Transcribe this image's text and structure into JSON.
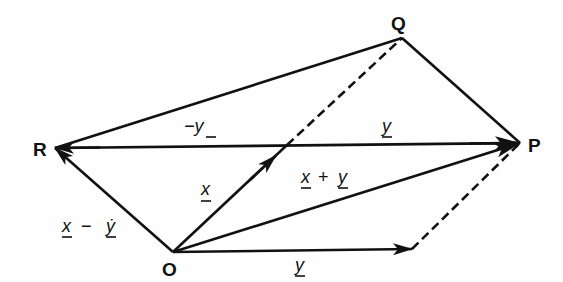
{
  "diagram": {
    "type": "vector-parallelogram",
    "points": {
      "O": {
        "label": "O",
        "x": 173,
        "y": 252
      },
      "P": {
        "label": "P",
        "x": 520,
        "y": 143
      },
      "Q": {
        "label": "Q",
        "x": 402,
        "y": 38
      },
      "R": {
        "label": "R",
        "x": 55,
        "y": 148
      }
    },
    "labels": {
      "x": "x",
      "y_top": "y",
      "y_bottom": "y",
      "neg_y": "−y",
      "x_plus_y_x": "x",
      "x_plus_y_op": "+",
      "x_plus_y_y": "y",
      "x_minus_y_x": "x",
      "x_minus_y_op": "−",
      "x_minus_y_y": "ẏ"
    },
    "edges": [
      {
        "from": "O",
        "to": "A",
        "label": "x",
        "style": "arrow"
      },
      {
        "from": "A",
        "to": "Q",
        "style": "dashed"
      },
      {
        "from": "O",
        "to": "B",
        "label": "y",
        "style": "arrow"
      },
      {
        "from": "B",
        "to": "P",
        "style": "dashed"
      },
      {
        "from": "O",
        "to": "P",
        "label": "x + y",
        "style": "arrow"
      },
      {
        "from": "O",
        "to": "R",
        "label": "x − y",
        "style": "arrow"
      },
      {
        "from": "R",
        "to": "P",
        "label": "y",
        "style": "arrow"
      },
      {
        "from": "P",
        "to": "R",
        "label": "−y",
        "style": "arrow"
      },
      {
        "from": "R",
        "to": "Q",
        "style": "solid"
      },
      {
        "from": "Q",
        "to": "P",
        "style": "solid"
      }
    ],
    "colors": {
      "ink": "#111111",
      "paper": "#fefefe"
    }
  }
}
